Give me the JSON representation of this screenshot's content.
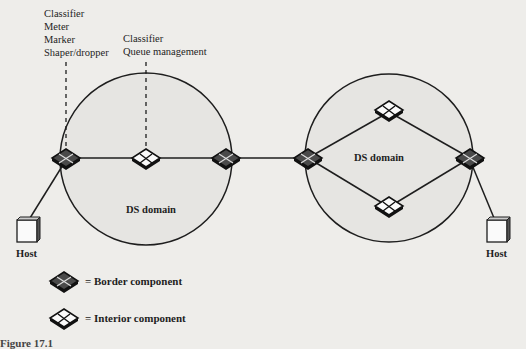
{
  "annotations": {
    "border_functions": [
      "Classifier",
      "Meter",
      "Marker",
      "Shaper/dropper"
    ],
    "interior_functions": [
      "Classifier",
      "Queue management"
    ]
  },
  "domains": [
    {
      "label": "DS domain",
      "cx": 146,
      "cy": 159,
      "r": 86
    },
    {
      "label": "DS domain",
      "cx": 389,
      "cy": 158,
      "r": 84
    }
  ],
  "hosts": [
    {
      "label": "Host",
      "x": 24,
      "y": 230
    },
    {
      "label": "Host",
      "x": 498,
      "y": 230
    }
  ],
  "legend": {
    "border_label": "= Border component",
    "interior_label": "= Interior component"
  },
  "colors": {
    "background": "#eeedea",
    "domain_fill": "#e6e5e2",
    "line": "#1e1e1e",
    "border_node_fill": "#5a5a5a"
  },
  "caption": "Figure 17.1"
}
